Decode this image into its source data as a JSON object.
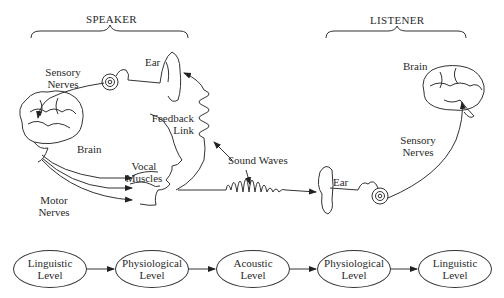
{
  "headers": {
    "speaker": "SPEAKER",
    "listener": "LISTENER"
  },
  "speaker_labels": {
    "ear": "Ear",
    "sensory_nerves_1": "Sensory",
    "sensory_nerves_2": "Nerves",
    "brain": "Brain",
    "feedback_1": "Feedback",
    "feedback_2": "Link",
    "vocal_1": "Vocal",
    "vocal_2": "Muscles",
    "motor_1": "Motor",
    "motor_2": "Nerves"
  },
  "middle_labels": {
    "sound_waves": "Sound Waves"
  },
  "listener_labels": {
    "brain": "Brain",
    "sensory_nerves_1": "Sensory",
    "sensory_nerves_2": "Nerves",
    "ear": "Ear"
  },
  "levels": [
    {
      "line1": "Linguistic",
      "line2": "Level"
    },
    {
      "line1": "Physiological",
      "line2": "Level"
    },
    {
      "line1": "Acoustic",
      "line2": "Level"
    },
    {
      "line1": "Physiological",
      "line2": "Level"
    },
    {
      "line1": "Linguistic",
      "line2": "Level"
    }
  ],
  "colors": {
    "line": "#333333",
    "background": "#ffffff"
  }
}
